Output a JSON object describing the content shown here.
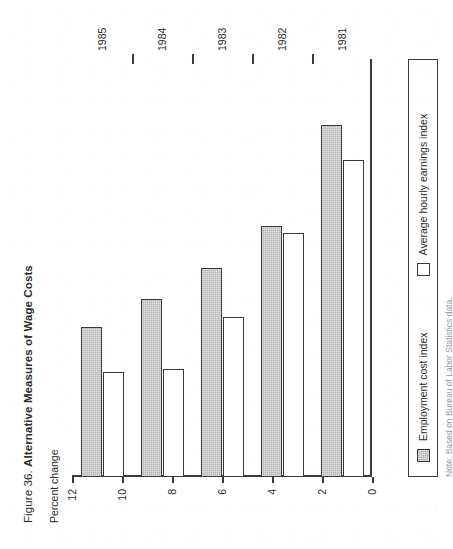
{
  "figure": {
    "number_label": "Figure 36.",
    "title": "Alternative Measures of Wage Costs",
    "axis_title": "Percent change",
    "note": "Note: Based on Bureau of Labor Statistics data."
  },
  "legend": {
    "items": [
      {
        "label": "Employment cost index",
        "swatch": "filled-gray-square",
        "color": "#b6b6b6"
      },
      {
        "label": "Average hourly earnings index",
        "swatch": "hollow-white-square",
        "color": "#ffffff"
      }
    ]
  },
  "axis": {
    "value_ticks": [
      "12",
      "10",
      "8",
      "6",
      "4",
      "2",
      "0"
    ],
    "category_ticks": [
      "1981",
      "1982",
      "1983",
      "1984",
      "1985"
    ]
  },
  "chart_data": {
    "type": "bar",
    "orientation": "horizontal",
    "title": "Figure 36. Alternative Measures of Wage Costs",
    "subtitle": "Percent change",
    "xlabel": "",
    "ylabel": "Percent change",
    "categories": [
      "1981",
      "1982",
      "1983",
      "1984",
      "1985"
    ],
    "series": [
      {
        "name": "Employment cost index",
        "values": [
          10.1,
          7.2,
          6.0,
          5.1,
          4.3
        ],
        "color": "#b6b6b6"
      },
      {
        "name": "Average hourly earnings index",
        "values": [
          9.1,
          7.0,
          4.6,
          3.1,
          3.0
        ],
        "color": "#ffffff"
      }
    ],
    "ylim": [
      0,
      12
    ],
    "ytick_step": 2,
    "grid": false,
    "legend_position": "bottom",
    "note": "Note: Based on Bureau of Labor Statistics data."
  }
}
